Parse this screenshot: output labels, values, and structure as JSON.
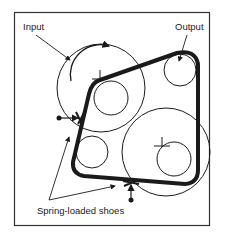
{
  "diagram": {
    "labels": {
      "input": "Input",
      "output": "Output",
      "shoes": "Spring-loaded shoes"
    },
    "colors": {
      "line": "#1a1a1a",
      "background": "#ffffff",
      "frame": "#333333"
    }
  }
}
